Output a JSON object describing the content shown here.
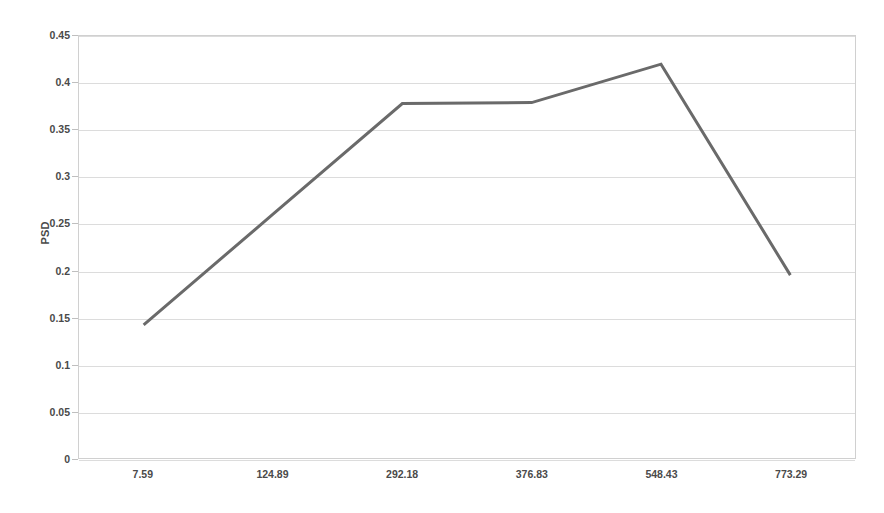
{
  "chart_data": {
    "type": "line",
    "title": "",
    "xlabel": "",
    "ylabel": "PSD",
    "categories": [
      "7.59",
      "124.89",
      "292.18",
      "376.83",
      "548.43",
      "773.29"
    ],
    "values": [
      0.142,
      0.26,
      0.378,
      0.379,
      0.42,
      0.195
    ],
    "series": [
      {
        "name": "PSD",
        "values": [
          0.142,
          0.26,
          0.378,
          0.379,
          0.42,
          0.195
        ],
        "color": "#6a6a6a"
      }
    ],
    "ylim": [
      0,
      0.45
    ],
    "ytick_labels": [
      "0",
      "0.05",
      "0.1",
      "0.15",
      "0.2",
      "0.25",
      "0.3",
      "0.35",
      "0.4",
      "0.45"
    ],
    "ytick_values": [
      0,
      0.05,
      0.1,
      0.15,
      0.2,
      0.25,
      0.3,
      0.35,
      0.4,
      0.45
    ],
    "grid": "horizontal",
    "legend": "none",
    "markers": "none",
    "line_width": 3,
    "background": "#ffffff",
    "grid_color": "#dcdcdc",
    "frame_color": "#d0d0d0",
    "text_color": "#4a4a4a"
  }
}
